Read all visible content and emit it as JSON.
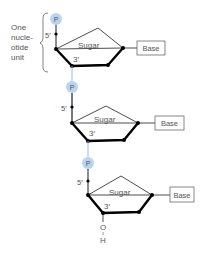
{
  "diagram": {
    "bracket_label": [
      "One",
      "nucle-",
      "otide",
      "unit"
    ],
    "phosphate_label": "P",
    "sugar_label": "Sugar",
    "base_label": "Base",
    "five_prime": "5′",
    "three_prime": "3′",
    "terminal_o": "O",
    "terminal_h": "H",
    "colors": {
      "phosphate_fill": "#b9d4ef",
      "phosphate_line": "#8bb6e0",
      "line": "#000000",
      "text": "#555555"
    }
  }
}
